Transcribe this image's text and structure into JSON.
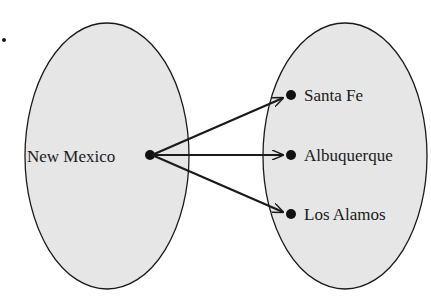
{
  "diagram": {
    "type": "mapping",
    "colors": {
      "set_fill": "#e6e6e6",
      "stroke": "#1a1a1a",
      "background": "#ffffff"
    },
    "domain_set": {
      "elements": [
        {
          "label": "New Mexico"
        }
      ]
    },
    "codomain_set": {
      "elements": [
        {
          "label": "Santa Fe"
        },
        {
          "label": "Albuquerque"
        },
        {
          "label": "Los Alamos"
        }
      ]
    },
    "arrows": [
      {
        "from": "New Mexico",
        "to": "Santa Fe"
      },
      {
        "from": "New Mexico",
        "to": "Albuquerque"
      },
      {
        "from": "New Mexico",
        "to": "Los Alamos"
      }
    ]
  }
}
